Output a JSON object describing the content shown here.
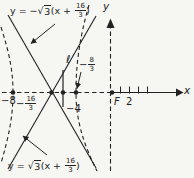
{
  "colors": {
    "ink": "#222222",
    "paper": "#f6f6f3"
  },
  "equations": {
    "top": {
      "pre": "y = −",
      "sqrt": "√",
      "radicand": "3",
      "mid": "(x + ",
      "num": "16",
      "den": "3",
      "post": ")"
    },
    "bottom": {
      "pre": "y = ",
      "sqrt": "√",
      "radicand": "3",
      "mid": "(x + ",
      "num": "16",
      "den": "3",
      "post": ")"
    }
  },
  "labels": {
    "neg8": "−8",
    "center_sign": "−",
    "center_num": "16",
    "center_den": "3",
    "neg4": "−4",
    "vertex_sign": "−",
    "vertex_num": "8",
    "vertex_den": "3",
    "directrix": "ℓ",
    "focus": "F",
    "tick2": "2",
    "x_axis": "x",
    "y_axis": "y"
  }
}
